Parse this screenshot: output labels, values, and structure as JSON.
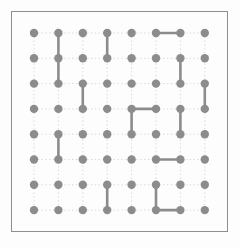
{
  "page": {
    "title": "Dot Grid Connection Puzzle",
    "caption": ""
  },
  "frame": {
    "border_color": "#8f8f8f",
    "background_color": "#fdfdfd",
    "left": 11,
    "top": 11,
    "width": 217,
    "height": 221
  },
  "grid": {
    "rows": 8,
    "columns": 8,
    "origin_x": 34,
    "origin_y": 33,
    "spacing_x": 24.4,
    "spacing_y": 25.3,
    "node_radius": 4.2,
    "node_color": "#8c8c8c",
    "guide_color": "#d8d8d8",
    "guide_style": "dotted",
    "edge_color": "#8c8c8c",
    "edge_width": 2.6
  },
  "edges": [
    {
      "id": "e1",
      "orientation": "vertical",
      "col": 2,
      "row_start": 1,
      "row_end": 2
    },
    {
      "id": "e2",
      "orientation": "vertical",
      "col": 2,
      "row_start": 2,
      "row_end": 3
    },
    {
      "id": "e3",
      "orientation": "vertical",
      "col": 4,
      "row_start": 1,
      "row_end": 2
    },
    {
      "id": "e4",
      "orientation": "horizontal",
      "row": 1,
      "col_start": 6,
      "col_end": 7
    },
    {
      "id": "e5",
      "orientation": "vertical",
      "col": 7,
      "row_start": 2,
      "row_end": 3
    },
    {
      "id": "e6",
      "orientation": "vertical",
      "col": 3,
      "row_start": 3,
      "row_end": 4
    },
    {
      "id": "e7",
      "orientation": "vertical",
      "col": 8,
      "row_start": 3,
      "row_end": 4
    },
    {
      "id": "e8",
      "orientation": "horizontal",
      "row": 4,
      "col_start": 5,
      "col_end": 6
    },
    {
      "id": "e9",
      "orientation": "vertical",
      "col": 5,
      "row_start": 4,
      "row_end": 5
    },
    {
      "id": "e10",
      "orientation": "vertical",
      "col": 7,
      "row_start": 4,
      "row_end": 5
    },
    {
      "id": "e11",
      "orientation": "vertical",
      "col": 2,
      "row_start": 5,
      "row_end": 6
    },
    {
      "id": "e12",
      "orientation": "horizontal",
      "row": 6,
      "col_start": 6,
      "col_end": 7
    },
    {
      "id": "e13",
      "orientation": "vertical",
      "col": 4,
      "row_start": 7,
      "row_end": 8
    },
    {
      "id": "e14",
      "orientation": "vertical",
      "col": 6,
      "row_start": 7,
      "row_end": 8
    },
    {
      "id": "e15",
      "orientation": "horizontal",
      "row": 8,
      "col_start": 6,
      "col_end": 7
    }
  ]
}
